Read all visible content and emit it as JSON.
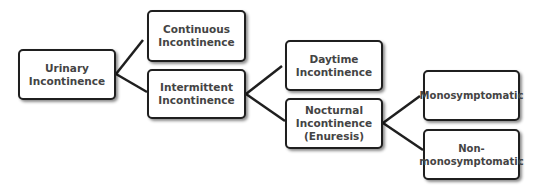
{
  "diagram": {
    "nodes": [
      {
        "id": "urinary",
        "label": "Urinary\nIncontinence"
      },
      {
        "id": "continuous",
        "label": "Continuous\nIncontinence"
      },
      {
        "id": "intermittent",
        "label": "Intermittent\nIncontinence"
      },
      {
        "id": "daytime",
        "label": "Daytime\nIncontinence"
      },
      {
        "id": "nocturnal",
        "label": "Nocturnal\nIncontinence\n(Enuresis)"
      },
      {
        "id": "mono",
        "label": "Monosymptomatic"
      },
      {
        "id": "nonmono",
        "label": "Non-\nmonosymptomatic"
      }
    ],
    "edges": [
      {
        "from": "urinary",
        "to": "continuous"
      },
      {
        "from": "urinary",
        "to": "intermittent"
      },
      {
        "from": "intermittent",
        "to": "daytime"
      },
      {
        "from": "intermittent",
        "to": "nocturnal"
      },
      {
        "from": "nocturnal",
        "to": "mono"
      },
      {
        "from": "nocturnal",
        "to": "nonmono"
      }
    ],
    "colors": {
      "border": "#1f1f1f",
      "text": "#444444",
      "line": "#1f1f1f",
      "background": "#ffffff"
    }
  }
}
